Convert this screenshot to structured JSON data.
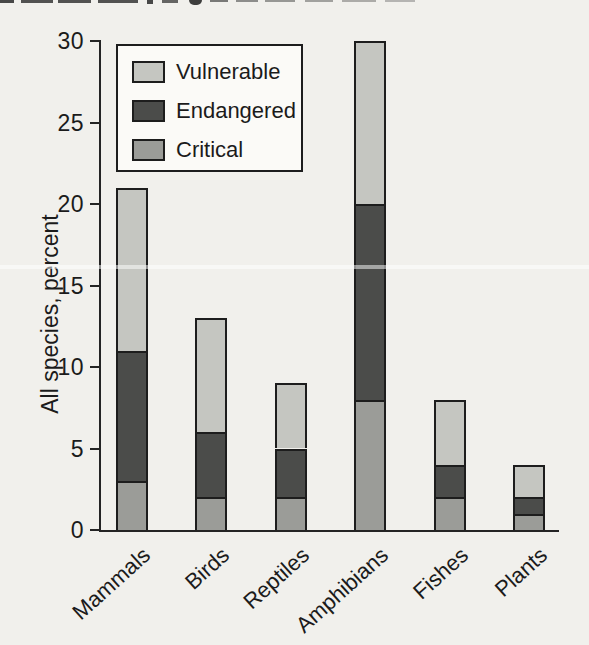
{
  "page": {
    "background": "#f1f0ec"
  },
  "chart_data": {
    "type": "bar",
    "stacked": true,
    "title": "",
    "xlabel": "",
    "ylabel": "All species, percent",
    "categories": [
      "Mammals",
      "Birds",
      "Reptiles",
      "Amphibians",
      "Fishes",
      "Plants"
    ],
    "series": [
      {
        "name": "Critical",
        "color": "#9b9c98",
        "values": [
          3,
          2,
          2,
          8,
          2,
          1
        ]
      },
      {
        "name": "Endangered",
        "color": "#4b4c4a",
        "values": [
          8,
          4,
          3,
          12,
          2,
          1
        ]
      },
      {
        "name": "Vulnerable",
        "color": "#c5c6c1",
        "values": [
          10,
          7,
          4,
          10,
          4,
          2
        ]
      }
    ],
    "stack_totals": [
      21,
      13,
      9,
      30,
      8,
      4
    ],
    "ylim": [
      0,
      30
    ],
    "yticks": [
      0,
      5,
      10,
      15,
      20,
      25,
      30
    ],
    "grid": false,
    "legend": {
      "position": "top-left",
      "entries": [
        {
          "label": "Vulnerable",
          "color": "#c5c6c1"
        },
        {
          "label": "Endangered",
          "color": "#4b4c4a"
        },
        {
          "label": "Critical",
          "color": "#9b9c98"
        }
      ]
    }
  },
  "colors": {
    "axis": "#242424",
    "text": "#1b1b1b",
    "legend_background": "#fbfaf7"
  }
}
